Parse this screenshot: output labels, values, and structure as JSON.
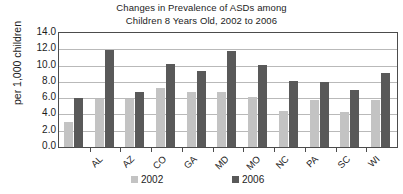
{
  "chart_data": {
    "type": "bar",
    "title": "Changes in Prevalence of ASDs among Children 8 Years Old, 2002 to 2006",
    "title_lines": [
      "Changes in Prevalence of ASDs among",
      "Children 8 Years Old, 2002 to 2006"
    ],
    "xlabel": "",
    "ylabel": "per 1,000 children",
    "ylim": [
      0.0,
      14.0
    ],
    "ytick_labels": [
      "14.0",
      "12.0",
      "10.0",
      "8.0",
      "6.0",
      "4.0",
      "2.0",
      "0.0"
    ],
    "ytick_values": [
      14.0,
      12.0,
      10.0,
      8.0,
      6.0,
      4.0,
      2.0,
      0.0
    ],
    "grid": true,
    "legend_position": "bottom",
    "categories": [
      "AL",
      "AZ",
      "CO",
      "GA",
      "MD",
      "MO",
      "NC",
      "PA",
      "SC",
      "WI",
      "Average"
    ],
    "series": [
      {
        "name": "2002",
        "color": "#c3c3c3",
        "values": [
          3.1,
          5.9,
          5.9,
          7.2,
          6.7,
          6.8,
          6.2,
          4.4,
          5.8,
          4.3,
          5.8
        ]
      },
      {
        "name": "2006",
        "color": "#595959",
        "values": [
          6.0,
          11.9,
          6.8,
          10.2,
          9.3,
          11.8,
          10.1,
          8.1,
          8.0,
          7.0,
          9.1
        ]
      }
    ]
  },
  "legend": {
    "entries": [
      {
        "label": "2002"
      },
      {
        "label": "2006"
      }
    ]
  },
  "colors": {
    "series_2002": "#c3c3c3",
    "series_2006": "#595959",
    "axis": "#4c4c4c",
    "gridline": "#b9b9b9",
    "background": "#ffffff",
    "text": "#1c1c1c"
  }
}
